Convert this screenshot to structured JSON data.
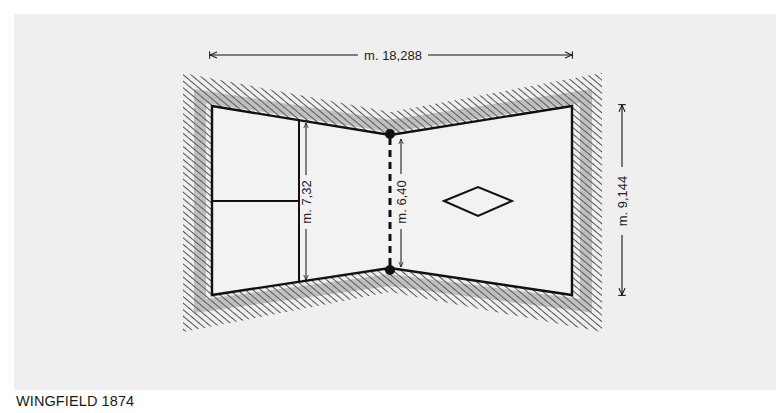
{
  "caption": "WINGFIELD 1874",
  "dimensions": {
    "overall_length": "m. 18,288",
    "baseline_width": "m. 9,144",
    "service_line_width": "m. 7,32",
    "net_width": "m. 6,40"
  },
  "colors": {
    "background": "#efefef",
    "line": "#111111",
    "court_fill": "#f2f2f2",
    "hatch": "#2a2a2a"
  },
  "figure": {
    "type": "tennis-court-plan",
    "shape": "hourglass",
    "elements": [
      "hatched-surround",
      "court-outline",
      "service-line",
      "center-service-line",
      "net-dashed-line",
      "net-posts",
      "diamond-marker",
      "dimension-arrows"
    ]
  }
}
